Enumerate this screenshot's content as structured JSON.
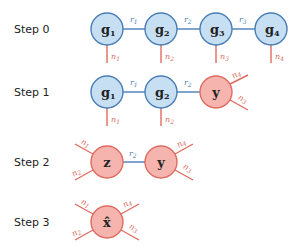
{
  "colors": {
    "blue_fill": "#c7dff2",
    "blue_stroke": "#4a7db5",
    "red_fill": "#f5b4ad",
    "red_stroke": "#e06b60",
    "red_text": "#d9685e",
    "blue_text": "#4a7db5"
  },
  "steps": [
    {
      "label": "Step 0",
      "nodes": [
        {
          "label": "g1",
          "sym": "g",
          "sub": "1",
          "color": "blue"
        },
        {
          "label": "g2",
          "sym": "g",
          "sub": "2",
          "color": "blue"
        },
        {
          "label": "g3",
          "sym": "g",
          "sub": "3",
          "color": "blue"
        },
        {
          "label": "g4",
          "sym": "g",
          "sub": "4",
          "color": "blue"
        }
      ],
      "bonds": [
        "r1",
        "r2",
        "r3"
      ],
      "legs": [
        "n1",
        "n2",
        "n3",
        "n4"
      ]
    },
    {
      "label": "Step 1",
      "nodes": [
        {
          "label": "g1",
          "sym": "g",
          "sub": "1",
          "color": "blue"
        },
        {
          "label": "g2",
          "sym": "g",
          "sub": "2",
          "color": "blue"
        },
        {
          "label": "y",
          "sym": "y",
          "sub": "",
          "color": "red"
        }
      ],
      "bonds": [
        "r1",
        "r2"
      ],
      "legs": [
        "n1",
        "n2",
        "n4",
        "n3"
      ]
    },
    {
      "label": "Step 2",
      "nodes": [
        {
          "label": "z",
          "sym": "z",
          "sub": "",
          "color": "red"
        },
        {
          "label": "y",
          "sym": "y",
          "sub": "",
          "color": "red"
        }
      ],
      "bonds": [
        "r2"
      ],
      "legs": [
        "n1",
        "n2",
        "n4",
        "n3"
      ]
    },
    {
      "label": "Step 3",
      "nodes": [
        {
          "label": "x-hat",
          "sym": "x̂",
          "sub": "",
          "color": "red"
        }
      ],
      "bonds": [],
      "legs": [
        "n1",
        "n2",
        "n4",
        "n3"
      ]
    }
  ],
  "text": {
    "s0": "Step 0",
    "s1": "Step 1",
    "s2": "Step 2",
    "s3": "Step 3",
    "g": "g",
    "y": "y",
    "z": "z",
    "xhat": "x̂",
    "sub1": "1",
    "sub2": "2",
    "sub3": "3",
    "sub4": "4",
    "r": "r",
    "n": "n"
  }
}
